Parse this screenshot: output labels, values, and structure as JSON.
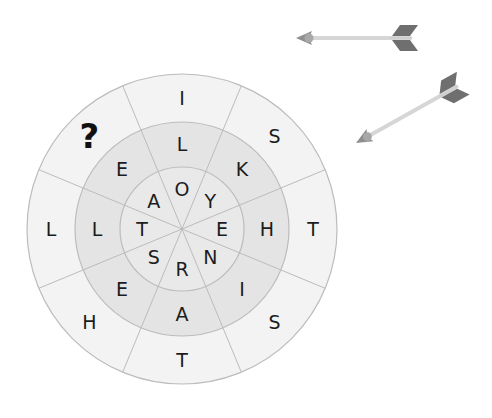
{
  "puzzle": {
    "type": "word-target",
    "sectors": 8,
    "rings": {
      "outer": [
        "I",
        "S",
        "T",
        "S",
        "T",
        "H",
        "L",
        "?"
      ],
      "middle": [
        "L",
        "K",
        "H",
        "I",
        "A",
        "E",
        "L",
        "E"
      ],
      "inner": [
        "O",
        "Y",
        "E",
        "N",
        "R",
        "S",
        "T",
        "A"
      ]
    },
    "missing_marker": "?"
  },
  "colors": {
    "outer_fill": "#f3f3f3",
    "middle_fill": "#e4e4e4",
    "inner_fill": "#e9e9e9",
    "line": "#bcbcbc",
    "arrow_shaft": "#d6d6d6",
    "arrow_head": "#8f8f8f",
    "arrow_fletch": "#6f6f6f"
  },
  "decorations": {
    "arrows": [
      {
        "name": "arrow-top",
        "tip": [
          296,
          38
        ],
        "tail": [
          412,
          38
        ]
      },
      {
        "name": "arrow-diagonal",
        "tip": [
          356,
          143
        ],
        "tail": [
          458,
          86
        ]
      }
    ]
  }
}
